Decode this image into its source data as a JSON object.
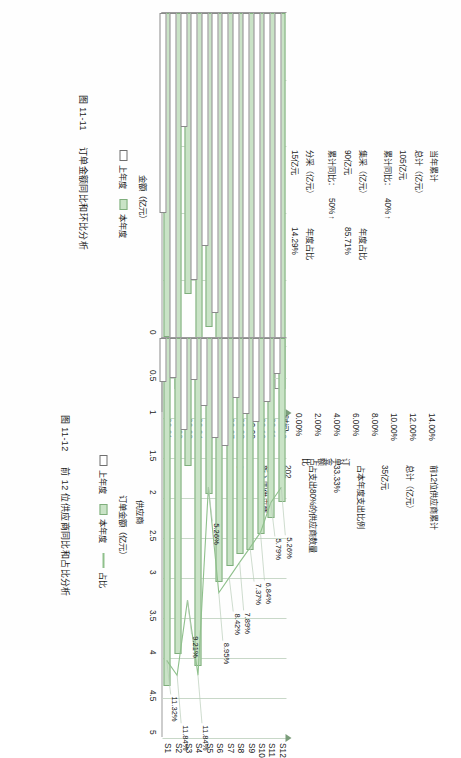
{
  "page": {
    "orientation": "rotated-90-ccw",
    "bg": "#fefefe"
  },
  "colors": {
    "current_year_fill": "#c9e3c6",
    "current_year_stroke": "#7fae7c",
    "previous_year_fill": "#ffffff",
    "previous_year_stroke": "#8a8a8a",
    "grid": "#bfd5bf",
    "axis": "#9c9c9c",
    "series_line": "#8fc08c"
  },
  "left_panel": {
    "kpi": {
      "heading": "当年累计",
      "rows": [
        {
          "label": "总计（亿元）",
          "value": "105亿元",
          "compare_label": "累计同比：",
          "compare_value": "40%",
          "trend": "up",
          "share_label": "",
          "share_value": ""
        },
        {
          "label": "集采（亿元）",
          "value": "90亿元",
          "compare_label": "累计同比：",
          "compare_value": "50%",
          "trend": "up",
          "share_label": "年度占比",
          "share_value": "85.71%"
        },
        {
          "label": "分采（亿元）",
          "value": "15亿元",
          "compare_label": "累计同比：",
          "compare_value": "-7%",
          "trend": "down",
          "share_label": "年度占比",
          "share_value": "14.29%"
        }
      ]
    },
    "chart": {
      "axis_tip_label": "时间",
      "y_axis_title": "金额（亿元）",
      "legend": [
        {
          "label": "上年度",
          "swatch": "previous"
        },
        {
          "label": "本年度",
          "swatch": "current"
        }
      ],
      "caption": "图 11-11  订单金额同比和环比分析"
    },
    "caption_number": "图 11-11",
    "caption_text": "订单金额同比和环比分析"
  },
  "right_panel": {
    "kpi": {
      "heading": "前12位供应商累计",
      "rows": [
        {
          "label": "总计（亿元）",
          "value": "35亿元"
        },
        {
          "label": "占本年度支出比例",
          "value": "33.33%"
        },
        {
          "label": "占支出80%的供应商数量",
          "value": "202"
        },
        {
          "label": "新入围供应商",
          "value": "3"
        }
      ],
      "vertical_label": "订单金额占比"
    },
    "chart": {
      "x_axis_title": "供应商",
      "y_axis_title": "订单金额（亿元）",
      "legend": [
        {
          "label": "上年度",
          "swatch": "previous"
        },
        {
          "label": "本年度",
          "swatch": "current"
        },
        {
          "label": "占比",
          "swatch": "line"
        }
      ],
      "caption": "图 11-12  前 12 位供应商同比和占比分析"
    },
    "caption_number": "图 11-12",
    "caption_text": "前 12 位供应商同比和占比分析"
  },
  "chart_data": [
    {
      "id": "order-amount-chart",
      "type": "bar",
      "title": "订单金额同比和环比分析",
      "xlabel": "时间",
      "ylabel": "金额（亿元）",
      "grid": true,
      "legend_position": "bottom",
      "categories": [
        "20.01",
        "20.02",
        "20.03",
        "20.04",
        "20.05",
        "20.06",
        "20.07",
        "20.08",
        "20.09",
        "20.10",
        "20.11",
        "20.12"
      ],
      "series": [
        {
          "name": "上年度",
          "values": [
            4.2,
            7.3,
            2.4,
            5.6,
            4.9,
            6.3,
            7.9,
            7.9,
            7.9,
            7.9,
            7.9,
            7.9
          ]
        },
        {
          "name": "本年度",
          "values": [
            6.8,
            7.9,
            5.9,
            6.9,
            6.6,
            7.1,
            7.7,
            7.9,
            7.9,
            7.9,
            7.9,
            7.9
          ]
        }
      ],
      "xlim": [
        0,
        8.4
      ],
      "n_gridlines": 5
    },
    {
      "id": "supplier-chart",
      "type": "bar",
      "title": "前 12 位供应商同比和占比分析",
      "xlabel": "供应商",
      "ylabel": "订单金额（亿元）",
      "grid": true,
      "legend_position": "bottom",
      "categories": [
        "S1",
        "S2",
        "S3",
        "S4",
        "S5",
        "S6",
        "S7",
        "S8",
        "S9",
        "S10",
        "S11",
        "S12"
      ],
      "ytick_labels": [
        "0",
        "0.5",
        "1",
        "1.5",
        "2",
        "2.5",
        "3",
        "3.5",
        "4",
        "4.5",
        "5"
      ],
      "ylim": [
        0,
        5
      ],
      "pct_axis_labels": [
        "0.00%",
        "2.00%",
        "4.00%",
        "6.00%",
        "8.00%",
        "10.00%",
        "12.00%",
        "14.00%"
      ],
      "pct_axis_lim": [
        0,
        14
      ],
      "series": [
        {
          "name": "上年度",
          "values": [
            0.55,
            0.5,
            1.15,
            0.52,
            0.85,
            1.25,
            1.35,
            0.75,
            0.95,
            1.05,
            0.8,
            0.45
          ]
        },
        {
          "name": "本年度",
          "values": [
            4.35,
            3.95,
            1.6,
            4.1,
            1.95,
            3.05,
            2.85,
            2.7,
            2.65,
            2.45,
            2.25,
            2.05
          ]
        },
        {
          "name": "占比",
          "values": [
            11.32,
            11.84,
            9.21,
            11.84,
            5.26,
            8.95,
            8.42,
            7.89,
            7.37,
            6.84,
            5.79,
            5.26
          ],
          "labels": [
            "11.32%",
            "11.84%",
            "9.21%",
            "11.84%",
            "5.26%",
            "8.95%",
            "8.42%",
            "7.89%",
            "7.37%",
            "6.84%",
            "5.79%",
            "5.26%"
          ]
        }
      ]
    }
  ]
}
